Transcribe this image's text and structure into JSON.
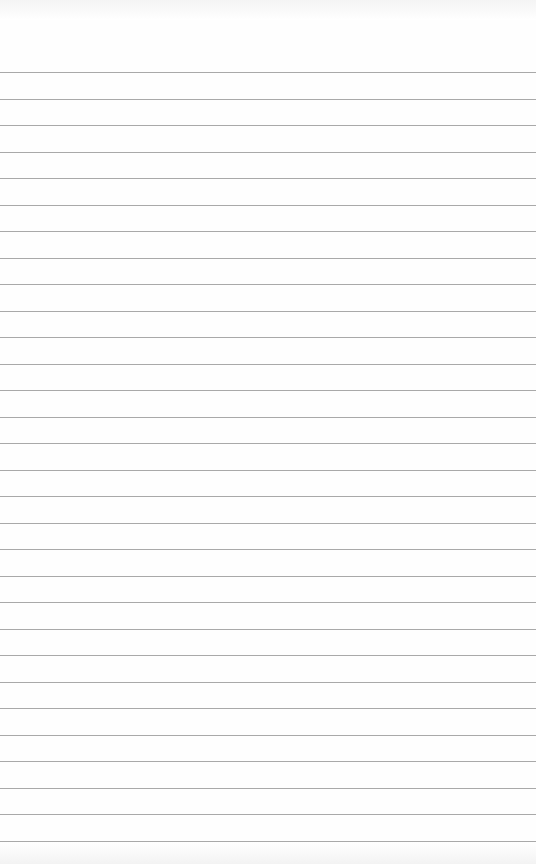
{
  "page": {
    "type": "lined-paper",
    "background_color": "#fefefe",
    "line_color": "#9a9a9a",
    "line_count": 30,
    "first_line_y": 72,
    "line_spacing": 26.5
  }
}
